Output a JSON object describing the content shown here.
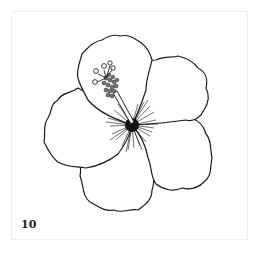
{
  "page": {
    "page_number": "10",
    "colors": {
      "background": "#ffffff",
      "frame": "#efefef",
      "ink": "#1a1a1a"
    }
  }
}
